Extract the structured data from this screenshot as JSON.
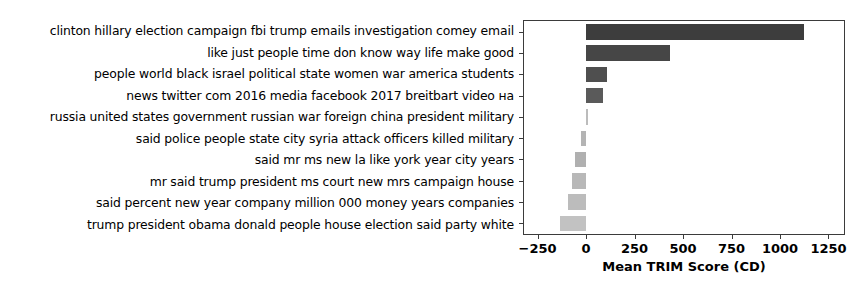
{
  "chart_data": {
    "type": "bar",
    "orientation": "horizontal",
    "title": "",
    "xlabel": "Mean TRIM Score (CD)",
    "ylabel": "",
    "xlim": [
      -320,
      1330
    ],
    "xticks": [
      -250,
      0,
      250,
      500,
      750,
      1000,
      1250
    ],
    "xtick_labels": [
      "−250",
      "0",
      "250",
      "500",
      "750",
      "1000",
      "1250"
    ],
    "grid": false,
    "legend": false,
    "categories": [
      "clinton hillary election campaign fbi trump emails investigation comey email",
      "like just people time don know way life make good",
      "people world black israel political state women war america students",
      "news twitter com 2016 media facebook 2017 breitbart video на",
      "russia united states government russian war foreign china president military",
      "said police people state city syria attack officers killed military",
      "said mr ms new la like york year city years",
      "mr said trump president ms court new mrs campaign house",
      "said percent new year company million 000 money years companies",
      "trump president obama donald people house election said party white"
    ],
    "values": [
      1125,
      435,
      110,
      85,
      12,
      -28,
      -55,
      -72,
      -95,
      -135
    ],
    "bar_colors": [
      "#3d3d3d",
      "#464646",
      "#4f4f4f",
      "#5a5a5a",
      "#bcbcbc",
      "#b4b4b4",
      "#b0b0b0",
      "#b8b8b8",
      "#bcbcbc",
      "#c2c2c2"
    ]
  }
}
